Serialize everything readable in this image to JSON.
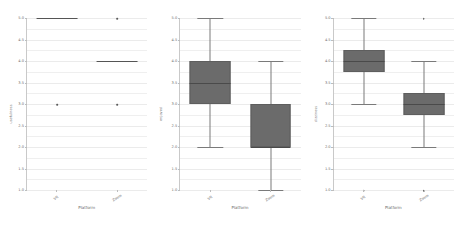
{
  "figure": {
    "panel_count": 3,
    "shared_xlabel": "Platform",
    "categories": [
      "VR",
      "Zoom"
    ],
    "ytick_labels": [
      "1.0",
      "1.5",
      "2.0",
      "2.5",
      "3.0",
      "3.5",
      "4.0",
      "4.5",
      "5.0"
    ],
    "ylim": [
      1.0,
      5.0
    ],
    "box_fill": "#6b6b6b",
    "grid_color": "#ebebeb",
    "axis_color": "#c9c9c9"
  },
  "chart_data": [
    {
      "type": "box",
      "title": "",
      "xlabel": "Platform",
      "ylabel": "usefulness",
      "ylim": [
        1.0,
        5.0
      ],
      "grid": true,
      "legend": "none",
      "categories": [
        "VR",
        "Zoom"
      ],
      "boxes": [
        {
          "name": "VR",
          "whisker_low": 5.0,
          "q1": 5.0,
          "median": 5.0,
          "q3": 5.0,
          "whisker_high": 5.0,
          "degenerate": true,
          "outliers": [
            3.0
          ]
        },
        {
          "name": "Zoom",
          "whisker_low": 4.0,
          "q1": 4.0,
          "median": 4.0,
          "q3": 4.0,
          "whisker_high": 4.0,
          "degenerate": true,
          "outliers": [
            5.0,
            3.0
          ]
        }
      ]
    },
    {
      "type": "box",
      "title": "",
      "xlabel": "Platform",
      "ylabel": "enjoyed",
      "ylim": [
        1.0,
        5.0
      ],
      "grid": true,
      "legend": "none",
      "categories": [
        "VR",
        "Zoom"
      ],
      "boxes": [
        {
          "name": "VR",
          "whisker_low": 2.0,
          "q1": 3.0,
          "median": 3.5,
          "q3": 4.0,
          "whisker_high": 5.0,
          "degenerate": false,
          "outliers": []
        },
        {
          "name": "Zoom",
          "whisker_low": 1.0,
          "q1": 2.0,
          "median": 2.0,
          "q3": 3.0,
          "whisker_high": 4.0,
          "degenerate": false,
          "outliers": []
        }
      ]
    },
    {
      "type": "box",
      "title": "",
      "xlabel": "Platform",
      "ylabel": "dizziness",
      "ylim": [
        1.0,
        5.0
      ],
      "grid": true,
      "legend": "none",
      "categories": [
        "VR",
        "Zoom"
      ],
      "boxes": [
        {
          "name": "VR",
          "whisker_low": 3.0,
          "q1": 3.75,
          "median": 4.0,
          "q3": 4.25,
          "whisker_high": 5.0,
          "degenerate": false,
          "outliers": [
            1.0
          ]
        },
        {
          "name": "Zoom",
          "whisker_low": 2.0,
          "q1": 2.75,
          "median": 3.0,
          "q3": 3.25,
          "whisker_high": 4.0,
          "degenerate": false,
          "outliers": [
            5.0,
            1.0
          ]
        }
      ]
    }
  ]
}
